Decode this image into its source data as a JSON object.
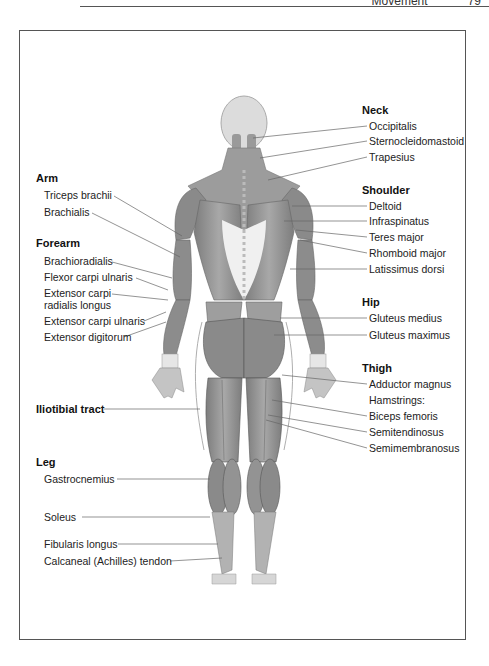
{
  "running_head": {
    "section": "Movement",
    "page": "79"
  },
  "figure": {
    "view": "posterior",
    "groups": {
      "neck": {
        "title": "Neck",
        "labels": [
          "Occipitalis",
          "Sternocleidomastoid",
          "Trapesius"
        ]
      },
      "shoulder": {
        "title": "Shoulder",
        "labels": [
          "Deltoid",
          "Infraspinatus",
          "Teres major",
          "Rhomboid major",
          "Latissimus dorsi"
        ]
      },
      "hip": {
        "title": "Hip",
        "labels": [
          "Gluteus medius",
          "Gluteus maximus"
        ]
      },
      "thigh": {
        "title": "Thigh",
        "labels": [
          "Adductor magnus",
          "Hamstrings:",
          "Biceps femoris",
          "Semitendinosus",
          "Semimembranosus"
        ]
      },
      "arm": {
        "title": "Arm",
        "labels": [
          "Triceps brachii",
          "Brachialis"
        ]
      },
      "forearm": {
        "title": "Forearm",
        "labels": [
          "Brachioradialis",
          "Flexor carpi ulnaris",
          "Extensor carpi radialis longus",
          "Extensor carpi ulnaris",
          "Extensor digitorum"
        ]
      },
      "iliotibial": {
        "title": "Iliotibial tract"
      },
      "leg": {
        "title": "Leg",
        "labels": [
          "Gastrocnemius",
          "Soleus",
          "Fibularis longus",
          "Calcaneal (Achilles) tendon"
        ]
      }
    },
    "colors": {
      "muscle": "#8f8f8f",
      "muscle_light": "#b5b5b5",
      "tendon": "#e8e8e8",
      "leader": "#666666",
      "frame": "#555555"
    }
  }
}
